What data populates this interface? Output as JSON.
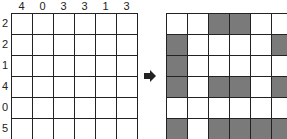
{
  "puzzle": {
    "column_clues": [
      "4",
      "0",
      "3",
      "3",
      "1",
      "3"
    ],
    "row_clues": [
      "2",
      "2",
      "1",
      "4",
      "0",
      "5"
    ],
    "size": 6
  },
  "solution": {
    "rows": [
      [
        0,
        0,
        1,
        1,
        0,
        0
      ],
      [
        1,
        0,
        0,
        0,
        0,
        1
      ],
      [
        1,
        0,
        0,
        0,
        0,
        0
      ],
      [
        1,
        0,
        1,
        1,
        0,
        1
      ],
      [
        0,
        0,
        0,
        0,
        0,
        0
      ],
      [
        1,
        0,
        1,
        1,
        1,
        1
      ]
    ],
    "fill_color": "#7a7a7a"
  },
  "arrow": {
    "icon": "right-arrow-icon"
  }
}
